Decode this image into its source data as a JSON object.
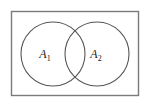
{
  "figure": {
    "type": "venn-diagram",
    "title": "",
    "universe": {
      "shape": "rectangle",
      "label": "",
      "stroke_color": "#7a7a7a",
      "fill_color": "#ffffff",
      "x": 11,
      "y": 11,
      "width": 128,
      "height": 85
    },
    "background_color": "#ffffff",
    "sets": [
      {
        "id": "set-a1",
        "label_base": "A",
        "label_subscript": "1",
        "label_full": "A1",
        "shape": "circle",
        "cx": 53,
        "cy": 54,
        "r": 32,
        "stroke_color": "#555555",
        "fill_color": "none",
        "label_x": 46,
        "label_y": 58
      },
      {
        "id": "set-a2",
        "label_base": "A",
        "label_subscript": "2",
        "label_full": "A2",
        "shape": "circle",
        "cx": 97,
        "cy": 54,
        "r": 32,
        "stroke_color": "#555555",
        "fill_color": "none",
        "label_x": 88,
        "label_y": 58
      }
    ],
    "intersection": {
      "present": true,
      "label": ""
    }
  }
}
